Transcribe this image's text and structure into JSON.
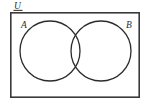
{
  "figure": {
    "kind": "venn-diagram",
    "width": 147,
    "height": 106,
    "background_color": "#ffffff"
  },
  "universe": {
    "label": "U",
    "label_underlined": true,
    "rect": {
      "x": 10,
      "y": 12,
      "width": 130,
      "height": 86
    },
    "stroke_color": "#3a3a3a",
    "stroke_width": 1.6,
    "fill_color": "#ffffff"
  },
  "sets": [
    {
      "label": "A",
      "label_x": 21,
      "label_y": 28,
      "circle": {
        "cx": 50,
        "cy": 51,
        "r": 30
      },
      "stroke_color": "#2b2b2b",
      "stroke_width": 1.3,
      "fill": "none"
    },
    {
      "label": "B",
      "label_x": 126,
      "label_y": 28,
      "circle": {
        "cx": 101,
        "cy": 51,
        "r": 30
      },
      "stroke_color": "#2b2b2b",
      "stroke_width": 1.3,
      "fill": "none"
    }
  ],
  "intersection": {
    "shaded": false,
    "top_point": {
      "x": 76,
      "y": 26
    },
    "bottom_point": {
      "x": 76,
      "y": 76
    }
  },
  "underline": {
    "x1": 14,
    "y1": 10,
    "x2": 22,
    "y2": 10
  }
}
